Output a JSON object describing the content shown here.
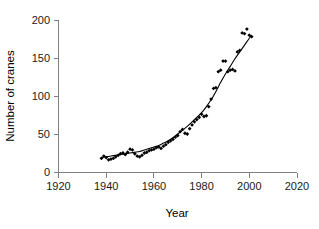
{
  "chart_data": {
    "type": "scatter",
    "title": "",
    "xlabel": "Year",
    "ylabel": "Number of cranes",
    "xlim": [
      1920,
      2020
    ],
    "ylim": [
      0,
      200
    ],
    "xticks": [
      1920,
      1940,
      1960,
      1980,
      2000,
      2020
    ],
    "yticks": [
      0,
      50,
      100,
      150,
      200
    ],
    "xtick_labels": [
      "1920",
      "1940",
      "1960",
      "1980",
      "2000",
      "2020"
    ],
    "ytick_labels": [
      "0",
      "50",
      "100",
      "150",
      "200"
    ],
    "grid": false,
    "legend": false,
    "marker_color": "#000000",
    "line_color": "#000000",
    "axis_color": "#808080",
    "background_color": "#ffffff",
    "series": [
      {
        "name": "Observed counts",
        "marker": "filled-diamond",
        "points": [
          [
            1938,
            18
          ],
          [
            1939,
            21
          ],
          [
            1940,
            19
          ],
          [
            1941,
            16
          ],
          [
            1942,
            17
          ],
          [
            1943,
            18
          ],
          [
            1944,
            20
          ],
          [
            1945,
            22
          ],
          [
            1946,
            24
          ],
          [
            1947,
            25
          ],
          [
            1948,
            23
          ],
          [
            1949,
            26
          ],
          [
            1950,
            30
          ],
          [
            1951,
            29
          ],
          [
            1952,
            24
          ],
          [
            1953,
            21
          ],
          [
            1954,
            20
          ],
          [
            1955,
            22
          ],
          [
            1956,
            25
          ],
          [
            1957,
            26
          ],
          [
            1958,
            28
          ],
          [
            1959,
            29
          ],
          [
            1960,
            30
          ],
          [
            1961,
            32
          ],
          [
            1962,
            33
          ],
          [
            1963,
            31
          ],
          [
            1964,
            34
          ],
          [
            1965,
            36
          ],
          [
            1966,
            39
          ],
          [
            1967,
            41
          ],
          [
            1968,
            43
          ],
          [
            1969,
            46
          ],
          [
            1970,
            48
          ],
          [
            1971,
            53
          ],
          [
            1972,
            56
          ],
          [
            1973,
            51
          ],
          [
            1974,
            50
          ],
          [
            1975,
            57
          ],
          [
            1976,
            62
          ],
          [
            1977,
            66
          ],
          [
            1978,
            69
          ],
          [
            1979,
            72
          ],
          [
            1980,
            76
          ],
          [
            1981,
            73
          ],
          [
            1982,
            74
          ],
          [
            1983,
            86
          ],
          [
            1984,
            96
          ],
          [
            1985,
            110
          ],
          [
            1986,
            111
          ],
          [
            1987,
            132
          ],
          [
            1988,
            134
          ],
          [
            1989,
            146
          ],
          [
            1990,
            146
          ],
          [
            1991,
            132
          ],
          [
            1992,
            134
          ],
          [
            1993,
            135
          ],
          [
            1994,
            133
          ],
          [
            1995,
            158
          ],
          [
            1996,
            160
          ],
          [
            1997,
            183
          ],
          [
            1998,
            182
          ],
          [
            1999,
            188
          ],
          [
            2000,
            180
          ],
          [
            2001,
            178
          ]
        ]
      }
    ],
    "fit_curve": {
      "name": "Exponential trend fit",
      "type": "exponential",
      "points": [
        [
          1938,
          19
        ],
        [
          1940,
          20
        ],
        [
          1942,
          21
        ],
        [
          1944,
          22
        ],
        [
          1946,
          23
        ],
        [
          1948,
          24
        ],
        [
          1950,
          25
        ],
        [
          1952,
          26
        ],
        [
          1954,
          27
        ],
        [
          1956,
          29
        ],
        [
          1958,
          31
        ],
        [
          1960,
          33
        ],
        [
          1962,
          35
        ],
        [
          1964,
          38
        ],
        [
          1966,
          41
        ],
        [
          1968,
          45
        ],
        [
          1970,
          50
        ],
        [
          1972,
          55
        ],
        [
          1974,
          60
        ],
        [
          1976,
          66
        ],
        [
          1978,
          72
        ],
        [
          1980,
          78
        ],
        [
          1982,
          86
        ],
        [
          1984,
          95
        ],
        [
          1986,
          106
        ],
        [
          1988,
          118
        ],
        [
          1990,
          129
        ],
        [
          1992,
          139
        ],
        [
          1994,
          149
        ],
        [
          1996,
          158
        ],
        [
          1998,
          167
        ],
        [
          2000,
          176
        ],
        [
          2001,
          180
        ]
      ]
    }
  }
}
